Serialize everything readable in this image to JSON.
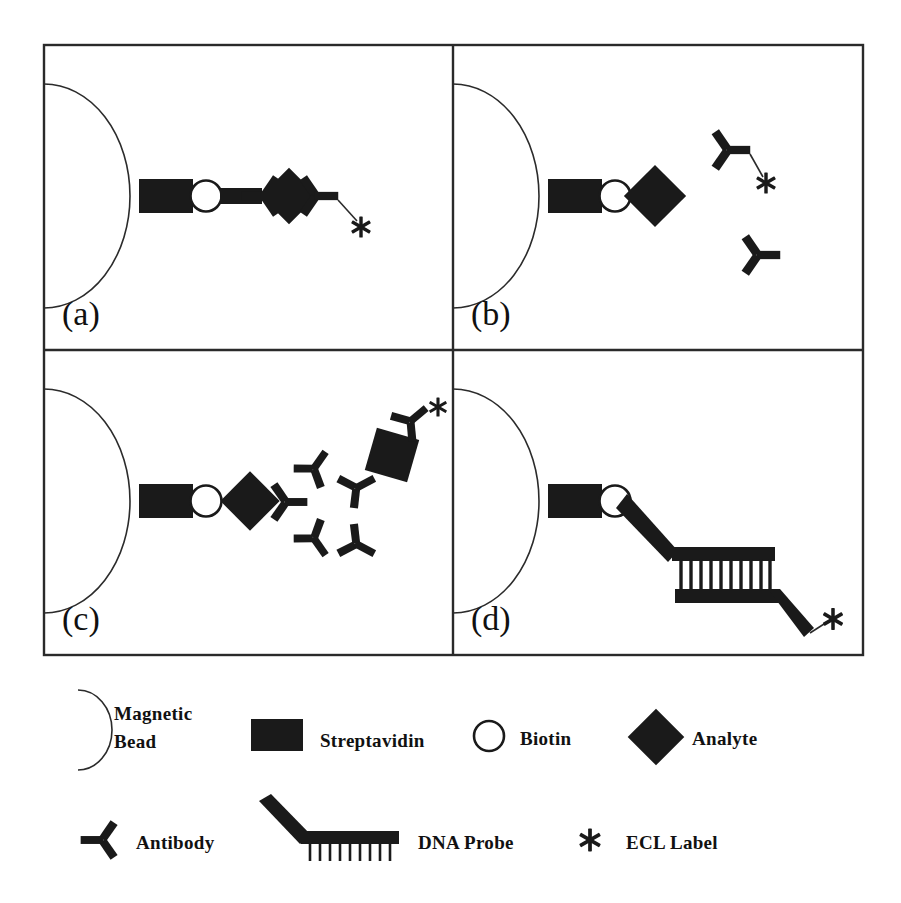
{
  "figure": {
    "ink_color": "#1a1a1a",
    "background_color": "#ffffff"
  },
  "panels": [
    {
      "id": "panel-a",
      "label": "(a)",
      "description": "Magnetic bead with streptavidin, biotin, capture antibody, analyte, detection antibody with ECL label",
      "components": [
        "magnetic-bead",
        "streptavidin",
        "biotin",
        "antibody",
        "analyte",
        "antibody",
        "ecl-label"
      ]
    },
    {
      "id": "panel-b",
      "label": "(b)",
      "description": "Magnetic bead with streptavidin and biotin, free analyte and two free antibodies one carrying an ECL label",
      "components": [
        "magnetic-bead",
        "streptavidin",
        "biotin",
        "analyte",
        "antibody",
        "ecl-label",
        "antibody"
      ]
    },
    {
      "id": "panel-c",
      "label": "(c)",
      "description": "Magnetic bead with streptavidin, biotin, analyte and branched antibody amplification network terminating in an ECL label",
      "components": [
        "magnetic-bead",
        "streptavidin",
        "biotin",
        "analyte",
        "antibody",
        "antibody",
        "antibody",
        "antibody",
        "analyte",
        "antibody",
        "ecl-label"
      ]
    },
    {
      "id": "panel-d",
      "label": "(d)",
      "description": "Magnetic bead with streptavidin, biotin and hybridised DNA probe duplex with ECL label",
      "components": [
        "magnetic-bead",
        "streptavidin",
        "biotin",
        "dna-probe",
        "ecl-label"
      ]
    }
  ],
  "legend": {
    "rows": [
      [
        {
          "key": "magnetic-bead",
          "icon": "magnetic-bead-icon",
          "label": "Magnetic Bead",
          "label_line1": "Magnetic",
          "label_line2": "Bead"
        },
        {
          "key": "streptavidin",
          "icon": "streptavidin-icon",
          "label": "Streptavidin"
        },
        {
          "key": "biotin",
          "icon": "biotin-icon",
          "label": "Biotin"
        },
        {
          "key": "analyte",
          "icon": "analyte-icon",
          "label": "Analyte"
        }
      ],
      [
        {
          "key": "antibody",
          "icon": "antibody-icon",
          "label": "Antibody"
        },
        {
          "key": "dna-probe",
          "icon": "dna-probe-icon",
          "label": "DNA Probe"
        },
        {
          "key": "ecl-label",
          "icon": "ecl-label-icon",
          "label": "ECL Label"
        }
      ]
    ]
  },
  "dna_probe": {
    "rung_count": 10
  }
}
